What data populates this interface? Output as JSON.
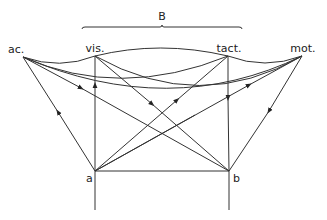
{
  "diagram": {
    "group_label": "B",
    "nodes": {
      "ac": {
        "label": "ac.",
        "x": 23,
        "y": 57
      },
      "vis": {
        "label": "vis.",
        "x": 95,
        "y": 56
      },
      "tact": {
        "label": "tact.",
        "x": 228,
        "y": 56
      },
      "mot": {
        "label": "mot.",
        "x": 302,
        "y": 56
      },
      "a": {
        "label": "a",
        "x": 95,
        "y": 171
      },
      "b": {
        "label": "b",
        "x": 229,
        "y": 171
      }
    },
    "brace": {
      "from_x": 82,
      "to_x": 242,
      "y": 27,
      "spans": [
        "vis.",
        "tact."
      ]
    },
    "edges": [
      {
        "from": "ac",
        "to": "vis",
        "type": "curve"
      },
      {
        "from": "ac",
        "to": "tact",
        "type": "curve"
      },
      {
        "from": "ac",
        "to": "mot",
        "type": "curve"
      },
      {
        "from": "vis",
        "to": "tact",
        "type": "curve"
      },
      {
        "from": "vis",
        "to": "mot",
        "type": "curve"
      },
      {
        "from": "tact",
        "to": "mot",
        "type": "curve"
      },
      {
        "from": "ac",
        "to": "b",
        "type": "arrow",
        "arrow_dir": "toward-b"
      },
      {
        "from": "a",
        "to": "ac",
        "type": "arrow",
        "arrow_dir": "toward-ac"
      },
      {
        "from": "a",
        "to": "vis",
        "type": "arrow",
        "arrow_dir": "toward-vis"
      },
      {
        "from": "vis",
        "to": "b",
        "type": "arrow",
        "arrow_dir": "toward-b"
      },
      {
        "from": "tact",
        "to": "b",
        "type": "arrow",
        "arrow_dir": "toward-b"
      },
      {
        "from": "a",
        "to": "tact",
        "type": "arrow",
        "arrow_dir": "toward-tact"
      },
      {
        "from": "a",
        "to": "mot",
        "type": "arrow",
        "arrow_dir": "toward-mot"
      },
      {
        "from": "mot",
        "to": "b",
        "type": "arrow",
        "arrow_dir": "toward-b"
      },
      {
        "from": "a",
        "to": "b",
        "type": "line"
      },
      {
        "from": "a",
        "to": "below",
        "type": "line"
      },
      {
        "from": "b",
        "to": "below",
        "type": "line"
      }
    ]
  }
}
